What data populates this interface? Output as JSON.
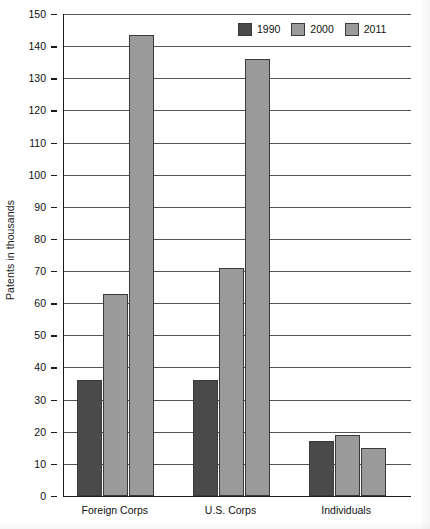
{
  "chart_data": {
    "type": "bar",
    "title": "",
    "xlabel": "",
    "ylabel": "Patents in thousands",
    "categories": [
      "Foreign Corps",
      "U.S. Corps",
      "Individuals"
    ],
    "series": [
      {
        "name": "1990",
        "color": "#4a4a4a",
        "values": [
          36,
          36,
          17
        ]
      },
      {
        "name": "2000",
        "color": "#9a9a9a",
        "values": [
          63,
          71,
          19
        ]
      },
      {
        "name": "2011",
        "color": "#9a9a9a",
        "values": [
          143.5,
          136,
          15
        ]
      }
    ],
    "ylim": [
      0,
      150
    ],
    "y_ticks": [
      0,
      10,
      20,
      30,
      40,
      50,
      60,
      70,
      80,
      90,
      100,
      110,
      120,
      130,
      140,
      150
    ],
    "y_tick_labels": [
      "0",
      "10",
      "20",
      "30",
      "40",
      "50",
      "60",
      "70",
      "80",
      "90",
      "100",
      "110",
      "120",
      "130",
      "140",
      "150"
    ],
    "grid": true,
    "legend_position": "top-right",
    "legend_entries": [
      "1990",
      "2000",
      "2011"
    ]
  },
  "colors": {
    "series_1990": "#4a4a4a",
    "series_2000": "#9a9a9a",
    "series_2011": "#9a9a9a",
    "axis": "#1a1a1a",
    "gridline": "#555555",
    "background": "#ffffff",
    "text": "#111111"
  }
}
